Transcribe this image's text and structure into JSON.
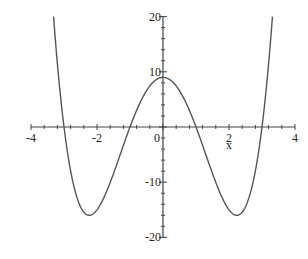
{
  "chart_data": {
    "type": "line",
    "title": "",
    "function": "x^4 - 10x^2 + 9",
    "xlabel": "x",
    "ylabel": "",
    "xlim": [
      -4,
      4
    ],
    "ylim": [
      -20,
      20
    ],
    "grid": false,
    "legend": null,
    "x_ticks": [
      -4,
      -2,
      0,
      2,
      4
    ],
    "x_tick_labels": [
      "-4",
      "-2",
      "0",
      "2",
      "4"
    ],
    "y_ticks": [
      -20,
      -10,
      10,
      20
    ],
    "y_tick_labels": [
      "-20",
      "-10",
      "10",
      "20"
    ],
    "series": [
      {
        "name": "f(x)",
        "color": "#555555",
        "x": [
          -3.317,
          -3.0,
          -2.5,
          -2.236,
          -2.0,
          -1.5,
          -1.0,
          -0.5,
          0.0,
          0.5,
          1.0,
          1.5,
          2.0,
          2.236,
          2.5,
          3.0,
          3.317
        ],
        "y": [
          20,
          0,
          -13.44,
          -16,
          -15,
          -8.44,
          0,
          6.56,
          9,
          6.56,
          0,
          -8.44,
          -15,
          -16,
          -13.44,
          0,
          20
        ]
      }
    ],
    "annotations": {
      "roots": [
        -3,
        -1,
        1,
        3
      ],
      "local_max": [
        0,
        9
      ],
      "local_min": [
        [
          -2.236,
          -16
        ],
        [
          2.236,
          -16
        ]
      ]
    }
  },
  "axes": {
    "origin_px": [
      163,
      127
    ],
    "x_px_per_unit": 33,
    "y_px_per_unit": 5.52,
    "color": "#444444",
    "curve_color": "#555555"
  }
}
